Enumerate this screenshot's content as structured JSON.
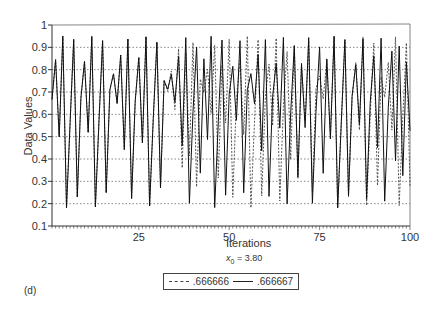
{
  "chart_data": {
    "type": "line",
    "title": "",
    "xlabel": "Iterations",
    "ylabel": "Data Values",
    "subtitle": "x0 = 3.80",
    "panel_label": "(d)",
    "xlim": [
      1,
      100
    ],
    "ylim": [
      0.1,
      1.0
    ],
    "xticks": [
      25,
      50,
      75,
      100
    ],
    "yticks": [
      0.1,
      0.2,
      0.3,
      0.4,
      0.5,
      0.6,
      0.7,
      0.8,
      0.9,
      1
    ],
    "ytick_labels": [
      "0.1",
      "0.2",
      "0.3",
      "0.4",
      "0.5",
      "0.6",
      "0.7",
      "0.8",
      "0.9",
      "1"
    ],
    "grid": "horizontal dotted",
    "legend_position": "bottom center",
    "r": 3.8,
    "series": [
      {
        "name": ".666666",
        "style": "dashed",
        "x0": 0.666666,
        "iterations": 100
      },
      {
        "name": ".666667",
        "style": "solid",
        "x0": 0.666667,
        "iterations": 100
      }
    ]
  },
  "labels": {
    "xlabel": "Iterations",
    "ylabel": "Data Values",
    "subtitle_var": "x",
    "subtitle_sub": "0",
    "subtitle_rest": " = 3.80",
    "panel": "(d)",
    "legend_a": ".666666",
    "legend_b": ".666667"
  }
}
